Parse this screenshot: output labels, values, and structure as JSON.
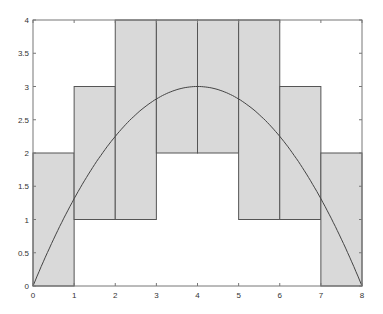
{
  "chart_data": {
    "type": "bar",
    "title": "",
    "xlabel": "",
    "ylabel": "",
    "xlim": [
      0,
      8
    ],
    "ylim": [
      0,
      4
    ],
    "xticks": [
      "0",
      "1",
      "2",
      "3",
      "4",
      "5",
      "6",
      "7",
      "8"
    ],
    "yticks": [
      "0",
      "0.5",
      "1",
      "1.5",
      "2",
      "2.5",
      "3",
      "3.5",
      "4"
    ],
    "categories": [
      "[0,1]",
      "[1,2]",
      "[2,3]",
      "[3,4]",
      "[4,5]",
      "[5,6]",
      "[6,7]",
      "[7,8]"
    ],
    "series": [
      {
        "name": "lower",
        "values": [
          0,
          1,
          1,
          2,
          2,
          1,
          1,
          0
        ]
      },
      {
        "name": "upper",
        "values": [
          2,
          3,
          4,
          4,
          4,
          4,
          3,
          2
        ]
      }
    ],
    "curve": {
      "name": "f(x) = 3x(8-x)/16",
      "x": [
        0,
        1,
        2,
        3,
        4,
        5,
        6,
        7,
        8
      ],
      "y": [
        0,
        1.3125,
        2.25,
        2.8125,
        3,
        2.8125,
        2.25,
        1.3125,
        0
      ]
    },
    "grid": false,
    "colors": {
      "bar_fill": "#d9d9d9",
      "edge": "#555555",
      "curve": "#444444"
    }
  }
}
